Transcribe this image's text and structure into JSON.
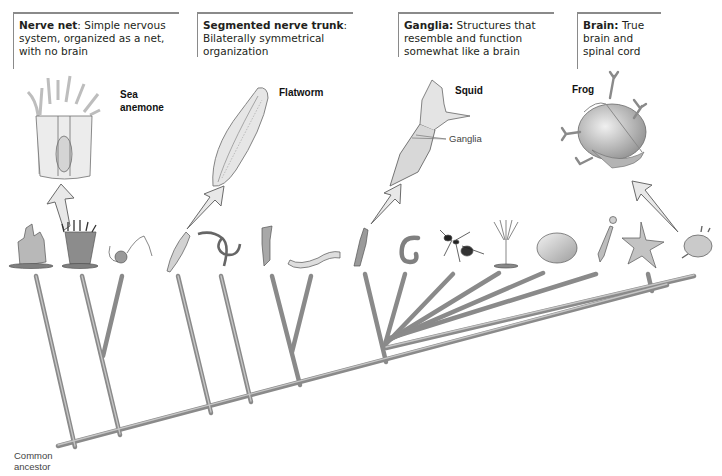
{
  "callouts": [
    {
      "title": "Nerve net",
      "sep": ": ",
      "text": "Simple nervous system, organized as a net, with no brain"
    },
    {
      "title": "Segmented nerve trunk",
      "sep": ": ",
      "text": "Bilaterally symmetrical organization"
    },
    {
      "title": "Ganglia:",
      "sep": " ",
      "text": "Structures that resemble and function somewhat like a brain"
    },
    {
      "title": "Brain:",
      "sep": " ",
      "text": "True brain and spinal cord"
    }
  ],
  "featured_organisms": [
    {
      "name": "Sea anemone",
      "line1": "Sea",
      "line2": "anemone"
    },
    {
      "name": "Flatworm"
    },
    {
      "name": "Squid",
      "annotation": "Ganglia"
    },
    {
      "name": "Frog"
    }
  ],
  "tree": {
    "root_label_line1": "Common",
    "root_label_line2": "ancestor",
    "tips": [
      "sponge",
      "sea anemone",
      "jellyfish",
      "flatworm",
      "ribbon worm",
      "rotifer",
      "roundworm",
      "squid",
      "earthworm",
      "ant",
      "crinoid",
      "clam",
      "hydroid-like",
      "sea star",
      "frog"
    ]
  },
  "colors": {
    "branch": "#9a9a9a",
    "branch_edge": "#6e6e6e",
    "arrow_fill": "#e6e6e6",
    "callout_border": "#8a8a8a"
  }
}
